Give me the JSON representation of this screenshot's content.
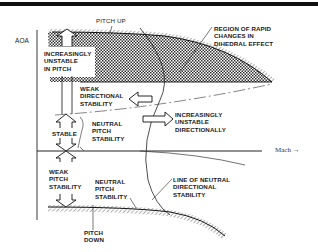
{
  "diagram": {
    "axes": {
      "y_label": "AOA",
      "x_label": "Mach →"
    },
    "labels": {
      "pitch_up": "PITCH UP",
      "pitch_down": "PITCH\nDOWN",
      "region_rapid": "REGION OF RAPID\nCHANGES IN\nDIHEDRAL EFFECT",
      "increasingly_unstable_pitch": "INCREASINGLY\nUNSTABLE\nIN PITCH",
      "weak_directional": "WEAK\nDIRECTIONAL\nSTABILITY",
      "increasingly_unstable_directionally": "INCREASINGLY\nUNSTABLE\nDIRECTIONALLY",
      "stable": "STABLE",
      "neutral_pitch_upper": "NEUTRAL\nPITCH\nSTABILITY",
      "weak_pitch": "WEAK\nPITCH\nSTABILITY",
      "neutral_pitch_lower": "NEUTRAL\nPITCH\nSTABILITY",
      "line_neutral_directional": "LINE OF NEUTRAL\nDIRECTIONAL\nSTABILITY"
    },
    "colors": {
      "ink": "#1a1a1a",
      "background": "#ffffff"
    }
  }
}
